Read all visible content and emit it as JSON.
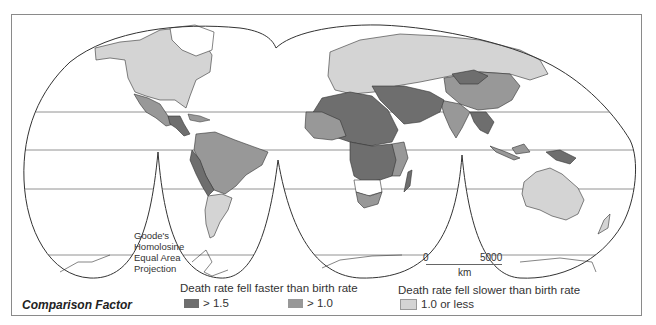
{
  "map": {
    "projection_label_lines": [
      "Goode's",
      "Homolosine",
      "Equal Area",
      "Projection"
    ],
    "scale_bar": {
      "start": "0",
      "end": "5000",
      "unit": "km"
    },
    "colors": {
      "high": "#6e6e6e",
      "mid": "#989898",
      "low": "#d4d4d4",
      "no_data": "#ffffff",
      "outline": "#333333",
      "graticule": "#777777"
    }
  },
  "legend": {
    "title": "Comparison Factor",
    "groups": [
      {
        "title": "Death rate fell faster than birth rate",
        "items": [
          {
            "label": "> 1.5",
            "color": "#6e6e6e"
          },
          {
            "label": "> 1.0",
            "color": "#989898"
          }
        ]
      },
      {
        "title": "Death rate fell slower than birth rate",
        "items": [
          {
            "label": "1.0 or less",
            "color": "#d4d4d4"
          }
        ]
      }
    ]
  }
}
